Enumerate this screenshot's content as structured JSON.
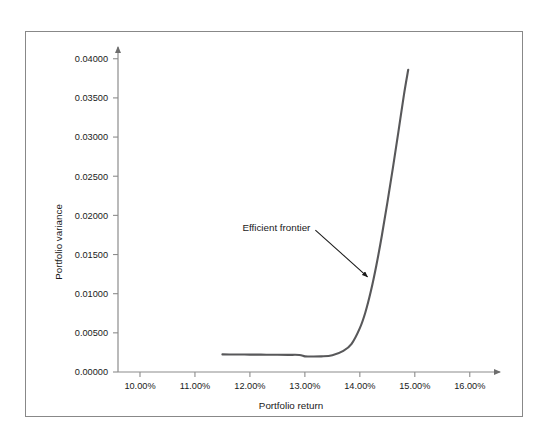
{
  "figure": {
    "border_color": "#888888",
    "background": "#ffffff"
  },
  "chart_data": {
    "type": "line",
    "title": "",
    "subtitle": "",
    "xlabel": "Portfolio return",
    "ylabel": "Portfolio variance",
    "grid": false,
    "legend": null,
    "legend_position": "none",
    "line_color": "#58585a",
    "axis_color": "#8c8c8c",
    "xtick_labels": [
      "10.00%",
      "11.00%",
      "12.00%",
      "13.00%",
      "14.00%",
      "15.00%",
      "16.00%"
    ],
    "xtick_values": [
      10.0,
      11.0,
      12.0,
      13.0,
      14.0,
      15.0,
      16.0
    ],
    "ytick_labels": [
      "0.00000",
      "0.00500",
      "0.01000",
      "0.01500",
      "0.02000",
      "0.02500",
      "0.03000",
      "0.03500",
      "0.04000"
    ],
    "ytick_values": [
      0.0,
      0.005,
      0.01,
      0.015,
      0.02,
      0.025,
      0.03,
      0.035,
      0.04
    ],
    "xlim": [
      9.6,
      16.55
    ],
    "ylim": [
      0.0,
      0.0415
    ],
    "series": [
      {
        "name": "Efficient frontier",
        "x": [
          11.5,
          11.7,
          11.9,
          12.1,
          12.3,
          12.5,
          12.7,
          12.9,
          13.0,
          13.1,
          13.3,
          13.5,
          13.7,
          13.85,
          14.0,
          14.1,
          14.2,
          14.3,
          14.4,
          14.5,
          14.6,
          14.7,
          14.8,
          14.88
        ],
        "y": [
          0.00225,
          0.00224,
          0.00223,
          0.00222,
          0.00221,
          0.0022,
          0.00219,
          0.00218,
          0.002,
          0.00198,
          0.002,
          0.00215,
          0.0027,
          0.0036,
          0.0056,
          0.0076,
          0.0103,
          0.0136,
          0.0174,
          0.0216,
          0.026,
          0.0306,
          0.0353,
          0.0386
        ]
      }
    ],
    "annotations": [
      {
        "text": "Efficient frontier",
        "text_x": 13.1,
        "text_y": 0.018,
        "arrow_tip_x": 14.14,
        "arrow_tip_y": 0.01215
      }
    ]
  }
}
